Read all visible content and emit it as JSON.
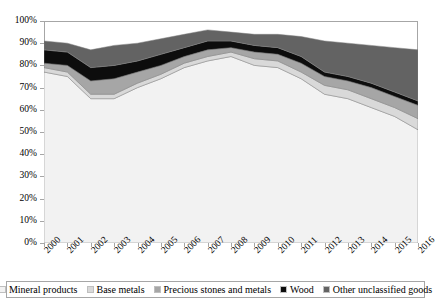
{
  "chart_data": {
    "type": "area",
    "title": "",
    "xlabel": "",
    "ylabel": "",
    "stacked": true,
    "grid": false,
    "legend_position": "bottom",
    "ylim": [
      0,
      100
    ],
    "ytick_labels": [
      "0%",
      "10%",
      "20%",
      "30%",
      "40%",
      "50%",
      "60%",
      "70%",
      "80%",
      "90%",
      "100%"
    ],
    "ytick_values": [
      0,
      10,
      20,
      30,
      40,
      50,
      60,
      70,
      80,
      90,
      100
    ],
    "categories": [
      "2000",
      "2001",
      "2002",
      "2003",
      "2004",
      "2005",
      "2006",
      "2007",
      "2008",
      "2009",
      "2010",
      "2011",
      "2012",
      "2013",
      "2014",
      "2015",
      "2016"
    ],
    "series": [
      {
        "name": "Mineral products",
        "color": "#f2f2f2",
        "values": [
          77,
          75,
          65,
          65,
          70,
          74,
          79,
          82,
          84,
          80,
          79,
          74,
          67,
          65,
          61,
          57,
          51
        ]
      },
      {
        "name": "Base metals",
        "color": "#d9d9d9",
        "values": [
          2,
          2,
          2,
          2,
          2,
          2,
          2,
          2,
          2,
          3,
          3,
          3,
          4,
          4,
          4,
          4,
          5
        ]
      },
      {
        "name": "Precious stones and metals",
        "color": "#a6a6a6",
        "values": [
          2,
          3,
          6,
          7,
          5,
          4,
          3,
          3,
          2,
          3,
          3,
          4,
          4,
          4,
          5,
          5,
          6
        ]
      },
      {
        "name": "Wood",
        "color": "#0d0d0d",
        "values": [
          6,
          6,
          6,
          6,
          5,
          5,
          4,
          4,
          3,
          3,
          3,
          3,
          2,
          2,
          2,
          2,
          2
        ]
      },
      {
        "name": "Other unclassified goods",
        "color": "#636363",
        "values": [
          4,
          4,
          8,
          9,
          8,
          7,
          6,
          5,
          4,
          5,
          6,
          9,
          14,
          15,
          17,
          20,
          23
        ]
      }
    ],
    "cumulative_tops": {
      "Mineral products": [
        77,
        75,
        65,
        65,
        70,
        74,
        79,
        82,
        84,
        80,
        79,
        74,
        67,
        65,
        61,
        57,
        51
      ],
      "Base metals": [
        79,
        77,
        67,
        67,
        72,
        76,
        81,
        84,
        86,
        83,
        82,
        77,
        71,
        69,
        65,
        61,
        56
      ],
      "Precious stones and metals": [
        81,
        80,
        73,
        74,
        77,
        80,
        84,
        87,
        88,
        86,
        85,
        81,
        75,
        73,
        70,
        66,
        62
      ],
      "Wood": [
        87,
        86,
        79,
        80,
        82,
        85,
        88,
        91,
        91,
        89,
        88,
        84,
        77,
        75,
        72,
        68,
        64
      ],
      "Other unclassified goods": [
        91,
        90,
        87,
        89,
        90,
        92,
        94,
        96,
        95,
        94,
        94,
        93,
        91,
        90,
        89,
        88,
        87
      ]
    }
  },
  "legend": {
    "items": [
      {
        "label": "Mineral products",
        "color": "#f2f2f2"
      },
      {
        "label": "Base metals",
        "color": "#d9d9d9"
      },
      {
        "label": "Precious stones and metals",
        "color": "#a6a6a6"
      },
      {
        "label": "Wood",
        "color": "#0d0d0d"
      },
      {
        "label": "Other unclassified goods",
        "color": "#636363"
      }
    ]
  }
}
